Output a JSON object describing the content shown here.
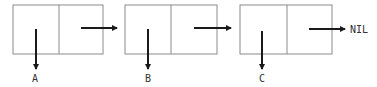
{
  "diagram": {
    "type": "linked-list",
    "colors": {
      "box_stroke": "#8a8a8a",
      "arrow": "#1a1a1a",
      "text": "#333333"
    },
    "nodes": [
      {
        "car_label": "A"
      },
      {
        "car_label": "B"
      },
      {
        "car_label": "C"
      }
    ],
    "terminator": "NIL"
  }
}
